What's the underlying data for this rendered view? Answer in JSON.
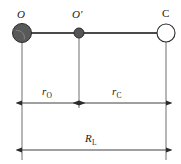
{
  "figure": {
    "type": "molecular-geometry-diagram",
    "background_color": "#ffffff",
    "line_color": "#4a4a4a",
    "text_color": "#1a1a1a"
  },
  "atoms": [
    {
      "id": "oxygen",
      "label": "O",
      "italic": true,
      "center_x": 22,
      "center_y": 33,
      "radius": 9.5,
      "fill": "#595959",
      "stroke": "#2b2b2b",
      "label_x": 17,
      "label_y": 9
    },
    {
      "id": "center-of-mass",
      "label": "O′",
      "italic": true,
      "center_x": 79,
      "center_y": 33,
      "radius": 5,
      "fill": "#555555",
      "stroke": "#2b2b2b",
      "label_x": 72,
      "label_y": 9
    },
    {
      "id": "carbon",
      "label": "C",
      "italic": false,
      "center_x": 166,
      "center_y": 33,
      "radius": 9,
      "fill": "#ffffff",
      "stroke": "#2b2b2b",
      "label_x": 162,
      "label_y": 8
    }
  ],
  "bond": {
    "name": "bond-axis",
    "x1": 22,
    "x2": 166,
    "y": 33,
    "width": 2.2,
    "color": "#4a4a4a"
  },
  "extension_lines": [
    {
      "id": "ext-oxygen",
      "x": 22,
      "y1": 42,
      "y2": 160
    },
    {
      "id": "ext-center",
      "x": 79,
      "y1": 38,
      "y2": 108
    },
    {
      "id": "ext-carbon",
      "x": 166,
      "y1": 42,
      "y2": 160
    }
  ],
  "dimensions": [
    {
      "id": "r-oxygen",
      "symbol": "r",
      "subscript": "O",
      "y": 103,
      "x_start": 22,
      "x_end": 79,
      "label_x": 42,
      "label_y": 86,
      "arrow_left": true,
      "arrow_right": true
    },
    {
      "id": "r-carbon",
      "symbol": "r",
      "subscript": "C",
      "y": 103,
      "x_start": 79,
      "x_end": 166,
      "label_x": 112,
      "label_y": 86,
      "arrow_left": true,
      "arrow_right": true
    },
    {
      "id": "R-length",
      "symbol": "R",
      "subscript": "L",
      "y": 150,
      "x_start": 22,
      "x_end": 166,
      "label_x": 85,
      "label_y": 133,
      "arrow_left": true,
      "arrow_right": true
    }
  ]
}
